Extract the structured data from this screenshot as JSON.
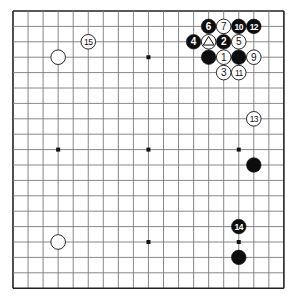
{
  "board": {
    "size": 19,
    "origin_x": 13,
    "origin_y": 11,
    "spacing_x": 15.05,
    "spacing_y": 15.4,
    "line_color": "#7a7a7a",
    "border_color": "#222222",
    "background": "#ffffff",
    "star_points": [
      [
        3,
        3
      ],
      [
        9,
        3
      ],
      [
        15,
        3
      ],
      [
        3,
        9
      ],
      [
        9,
        9
      ],
      [
        15,
        9
      ],
      [
        3,
        15
      ],
      [
        9,
        15
      ],
      [
        15,
        15
      ]
    ]
  },
  "stones": [
    {
      "color": "black",
      "col": 13,
      "row": 1,
      "label": "6"
    },
    {
      "color": "white",
      "col": 14,
      "row": 1,
      "label": "7"
    },
    {
      "color": "black",
      "col": 15,
      "row": 1,
      "label": "10"
    },
    {
      "color": "black",
      "col": 16,
      "row": 1,
      "label": "12"
    },
    {
      "color": "black",
      "col": 12,
      "row": 2,
      "label": "4"
    },
    {
      "color": "white",
      "col": 13,
      "row": 2,
      "label": "",
      "marker": "triangle"
    },
    {
      "color": "black",
      "col": 14,
      "row": 2,
      "label": "2"
    },
    {
      "color": "white",
      "col": 15,
      "row": 2,
      "label": "5"
    },
    {
      "color": "black",
      "col": 13,
      "row": 3,
      "label": ""
    },
    {
      "color": "white",
      "col": 14,
      "row": 3,
      "label": "1"
    },
    {
      "color": "black",
      "col": 15,
      "row": 3,
      "label": ""
    },
    {
      "color": "white",
      "col": 16,
      "row": 3,
      "label": "9"
    },
    {
      "color": "white",
      "col": 14,
      "row": 4,
      "label": "3"
    },
    {
      "color": "white",
      "col": 15,
      "row": 4,
      "label": "11"
    },
    {
      "color": "white",
      "col": 5,
      "row": 2,
      "label": "15"
    },
    {
      "color": "white",
      "col": 3,
      "row": 3,
      "label": ""
    },
    {
      "color": "white",
      "col": 16,
      "row": 7,
      "label": "13"
    },
    {
      "color": "black",
      "col": 16,
      "row": 10,
      "label": ""
    },
    {
      "color": "black",
      "col": 15,
      "row": 14,
      "label": "14"
    },
    {
      "color": "black",
      "col": 15,
      "row": 16,
      "label": ""
    },
    {
      "color": "white",
      "col": 3,
      "row": 15,
      "label": ""
    }
  ]
}
